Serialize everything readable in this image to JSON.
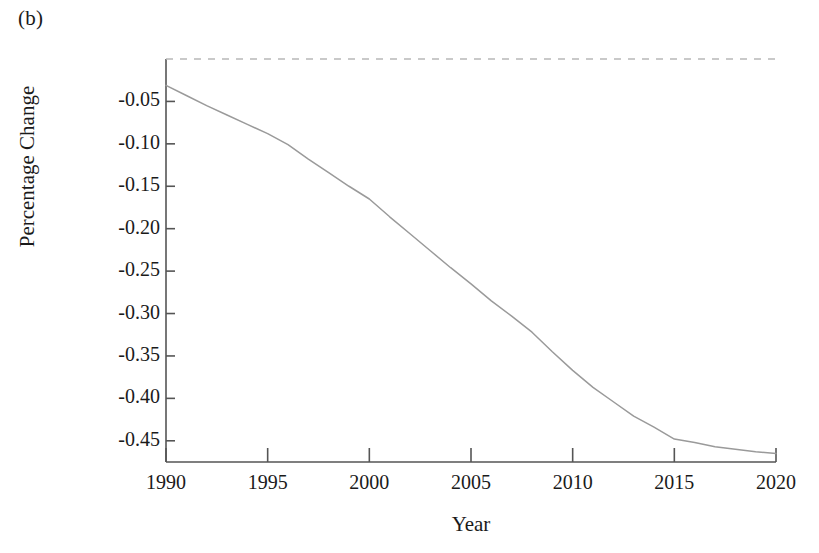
{
  "panel": {
    "label": "(b)"
  },
  "chart_data": {
    "type": "line",
    "title": "",
    "subtitle": "",
    "xlabel": "Year",
    "ylabel": "Percentage Change",
    "xlim": [
      1990,
      2020
    ],
    "ylim": [
      -0.475,
      0.0
    ],
    "grid": false,
    "legend": null,
    "x_ticks": [
      1990,
      1995,
      2000,
      2005,
      2010,
      2015,
      2020
    ],
    "x_tick_labels": [
      "1990",
      "1995",
      "2000",
      "2005",
      "2010",
      "2015",
      "2020"
    ],
    "y_ticks": [
      -0.05,
      -0.1,
      -0.15,
      -0.2,
      -0.25,
      -0.3,
      -0.35,
      -0.4,
      -0.45
    ],
    "y_tick_labels": [
      "-0.05",
      "-0.10",
      "-0.15",
      "-0.20",
      "-0.25",
      "-0.30",
      "-0.35",
      "-0.40",
      "-0.45"
    ],
    "annotations": [
      {
        "name": "zero-reference-line",
        "type": "hline",
        "y": 0.0,
        "style": "dashed",
        "color": "#b8b8b8"
      }
    ],
    "series": [
      {
        "name": "Percentage Change",
        "style": "solid",
        "color": "#9a9a9a",
        "x": [
          1990,
          1991,
          1992,
          1993,
          1994,
          1995,
          1996,
          1997,
          1998,
          1999,
          2000,
          2001,
          2002,
          2003,
          2004,
          2005,
          2006,
          2007,
          2008,
          2009,
          2010,
          2011,
          2012,
          2013,
          2014,
          2015,
          2016,
          2017,
          2018,
          2019,
          2020
        ],
        "values": [
          -0.031,
          -0.043,
          -0.055,
          -0.066,
          -0.077,
          -0.088,
          -0.101,
          -0.118,
          -0.134,
          -0.15,
          -0.165,
          -0.186,
          -0.206,
          -0.226,
          -0.246,
          -0.265,
          -0.285,
          -0.303,
          -0.322,
          -0.345,
          -0.367,
          -0.387,
          -0.404,
          -0.421,
          -0.434,
          -0.448,
          -0.452,
          -0.457,
          -0.46,
          -0.463,
          -0.465
        ]
      }
    ]
  },
  "axes": {
    "spine_color": "#555555",
    "tick_color": "#555555"
  }
}
